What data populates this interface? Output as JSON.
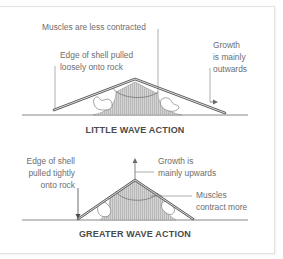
{
  "diagram": {
    "type": "labeled-illustration",
    "panels": [
      {
        "title": "LITTLE WAVE ACTION",
        "labels": {
          "muscles": "Muscles are less contracted",
          "edge_line1": "Edge of shell pulled",
          "edge_line2": "loosely onto rock",
          "growth_line1": "Growth",
          "growth_line2": "is mainly",
          "growth_line3": "outwards"
        }
      },
      {
        "title": "GREATER WAVE ACTION",
        "labels": {
          "edge_line1": "Edge of shell",
          "edge_line2": "pulled tightly",
          "edge_line3": "onto rock",
          "growth_line1": "Growth is",
          "growth_line2": "mainly upwards",
          "muscles_line1": "Muscles",
          "muscles_line2": "contract more"
        }
      }
    ],
    "colors": {
      "shell_outline": "#5a5a5a",
      "muscle_fill": "#c8c8c8",
      "leader_line": "#7a7a7a",
      "ground": "#6a6a6a",
      "text": "#6e6e6e",
      "title_text": "#4a4a4a",
      "frame_border": "#e2e2e2"
    }
  }
}
